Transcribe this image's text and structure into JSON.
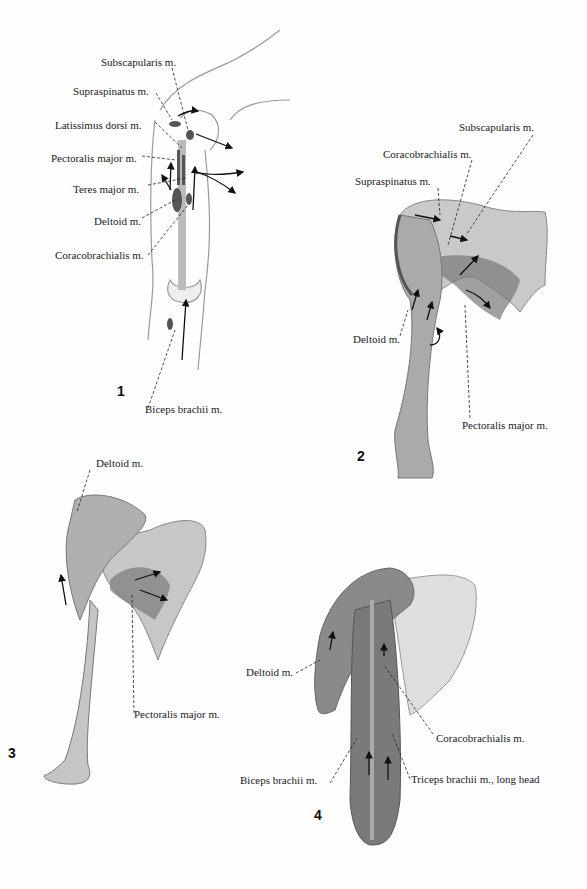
{
  "figures": [
    {
      "number": "1",
      "labels": {
        "subscapularis": "Subscapularis m.",
        "supraspinatus": "Supraspinatus m.",
        "latissimus": "Latissimus dorsi m.",
        "pectoralis": "Pectoralis major m.",
        "teres": "Teres major m.",
        "deltoid": "Deltoid m.",
        "coracobrachialis": "Coracobrachialis m.",
        "biceps": "Biceps brachii m."
      }
    },
    {
      "number": "2",
      "labels": {
        "subscapularis": "Subscapularis m.",
        "coracobrachialis": "Coracobrachialis m.",
        "supraspinatus": "Supraspinatus m.",
        "deltoid": "Deltoid m.",
        "pectoralis": "Pectoralis major m."
      }
    },
    {
      "number": "3",
      "labels": {
        "deltoid": "Deltoid m.",
        "pectoralis": "Pectoralis major m."
      }
    },
    {
      "number": "4",
      "labels": {
        "deltoid": "Deltoid m.",
        "coracobrachialis": "Coracobrachialis m.",
        "biceps": "Biceps brachii m.",
        "triceps": "Triceps brachii m., long head"
      }
    }
  ]
}
